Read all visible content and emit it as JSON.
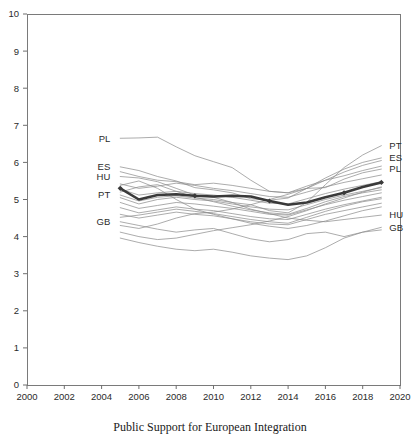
{
  "caption": "Public Support for European Integration",
  "chart_data": {
    "type": "line",
    "title": "",
    "subtitle": "",
    "xlabel": "",
    "ylabel": "",
    "xlim": [
      2000,
      2020
    ],
    "ylim": [
      0,
      10
    ],
    "xticks": [
      2000,
      2002,
      2004,
      2006,
      2008,
      2010,
      2012,
      2014,
      2016,
      2018,
      2020
    ],
    "yticks": [
      0,
      1,
      2,
      3,
      4,
      5,
      6,
      7,
      8,
      9,
      10
    ],
    "grid": false,
    "legend_position": "inline-endpoint-labels",
    "left_labels": [
      {
        "code": "PL",
        "value": 6.65
      },
      {
        "code": "ES",
        "value": 5.88
      },
      {
        "code": "HU",
        "value": 5.62
      },
      {
        "code": "PT",
        "value": 5.12
      },
      {
        "code": "GB",
        "value": 4.4
      }
    ],
    "right_labels": [
      {
        "code": "PT",
        "value": 6.45
      },
      {
        "code": "ES",
        "value": 6.12
      },
      {
        "code": "PL",
        "value": 5.82
      },
      {
        "code": "HU",
        "value": 4.58
      },
      {
        "code": "GB",
        "value": 4.25
      }
    ],
    "x": [
      2005,
      2006,
      2007,
      2008,
      2009,
      2010,
      2011,
      2012,
      2013,
      2014,
      2015,
      2016,
      2017,
      2018,
      2019
    ],
    "series": [
      {
        "name": "PL",
        "highlight": false,
        "values": [
          6.65,
          6.66,
          6.68,
          6.42,
          6.18,
          6.02,
          5.86,
          5.52,
          5.22,
          5.18,
          5.3,
          5.32,
          5.55,
          5.72,
          5.82
        ]
      },
      {
        "name": "ES",
        "highlight": false,
        "values": [
          5.88,
          5.78,
          5.62,
          5.5,
          5.32,
          5.26,
          5.18,
          5.02,
          4.98,
          5.04,
          5.3,
          5.58,
          5.82,
          6.0,
          6.12
        ]
      },
      {
        "name": "HU",
        "highlight": false,
        "values": [
          5.62,
          5.58,
          5.48,
          5.3,
          5.12,
          5.06,
          4.92,
          4.74,
          4.62,
          4.5,
          4.44,
          4.4,
          4.46,
          4.52,
          4.58
        ]
      },
      {
        "name": "PT",
        "highlight": false,
        "values": [
          5.12,
          4.96,
          5.06,
          5.1,
          5.04,
          5.0,
          4.92,
          4.86,
          4.7,
          4.64,
          4.92,
          5.4,
          5.86,
          6.2,
          6.45
        ]
      },
      {
        "name": "GB",
        "highlight": false,
        "values": [
          4.4,
          4.3,
          4.2,
          4.12,
          4.18,
          4.22,
          4.08,
          3.94,
          3.86,
          3.92,
          4.08,
          4.12,
          4.0,
          4.12,
          4.25
        ]
      },
      {
        "name": "country-06",
        "highlight": false,
        "values": [
          5.75,
          5.62,
          5.52,
          5.48,
          5.4,
          5.44,
          5.38,
          5.3,
          5.22,
          5.18,
          5.36,
          5.52,
          5.64,
          5.78,
          5.9
        ]
      },
      {
        "name": "country-07",
        "highlight": false,
        "values": [
          5.42,
          5.3,
          5.36,
          5.44,
          5.38,
          5.3,
          5.24,
          5.16,
          5.08,
          5.06,
          5.2,
          5.34,
          5.46,
          5.56,
          5.66
        ]
      },
      {
        "name": "country-08",
        "highlight": false,
        "values": [
          5.28,
          5.12,
          5.18,
          5.22,
          5.16,
          5.12,
          5.06,
          4.98,
          4.9,
          4.88,
          5.02,
          5.16,
          5.28,
          5.38,
          5.48
        ]
      },
      {
        "name": "country-09",
        "highlight": false,
        "values": [
          5.05,
          4.88,
          5.0,
          5.06,
          5.0,
          4.96,
          4.88,
          4.8,
          4.74,
          4.72,
          4.86,
          5.0,
          5.12,
          5.22,
          5.32
        ]
      },
      {
        "name": "country-10",
        "highlight": false,
        "values": [
          4.92,
          4.76,
          4.84,
          4.92,
          4.88,
          4.82,
          4.76,
          4.68,
          4.6,
          4.58,
          4.72,
          4.86,
          4.98,
          5.08,
          5.18
        ]
      },
      {
        "name": "country-11",
        "highlight": false,
        "values": [
          4.78,
          4.64,
          4.72,
          4.8,
          4.74,
          4.7,
          4.62,
          4.54,
          4.48,
          4.46,
          4.6,
          4.74,
          4.86,
          4.96,
          5.06
        ]
      },
      {
        "name": "country-12",
        "highlight": false,
        "values": [
          4.6,
          4.5,
          4.58,
          4.66,
          4.6,
          4.56,
          4.48,
          4.4,
          4.34,
          4.32,
          4.46,
          4.6,
          4.7,
          4.8,
          4.9
        ]
      },
      {
        "name": "country-13",
        "highlight": false,
        "values": [
          5.38,
          5.5,
          5.3,
          5.0,
          4.74,
          4.6,
          4.48,
          4.36,
          4.28,
          4.22,
          4.3,
          4.42,
          4.56,
          4.7,
          4.8
        ]
      },
      {
        "name": "country-14",
        "highlight": false,
        "values": [
          4.3,
          4.22,
          4.34,
          4.5,
          4.62,
          4.66,
          4.74,
          4.86,
          5.0,
          5.14,
          5.3,
          5.52,
          5.74,
          5.92,
          6.05
        ]
      },
      {
        "name": "country-15",
        "highlight": false,
        "values": [
          4.12,
          4.0,
          3.92,
          3.96,
          4.06,
          4.16,
          4.24,
          4.32,
          4.42,
          4.54,
          4.7,
          4.88,
          5.04,
          5.2,
          5.34
        ]
      },
      {
        "name": "country-16",
        "highlight": false,
        "values": [
          3.96,
          3.84,
          3.74,
          3.66,
          3.62,
          3.66,
          3.58,
          3.48,
          3.42,
          3.38,
          3.48,
          3.7,
          3.96,
          4.12,
          4.18
        ]
      },
      {
        "name": "country-17",
        "highlight": false,
        "values": [
          5.2,
          5.34,
          5.4,
          5.22,
          5.06,
          4.94,
          4.82,
          4.72,
          4.64,
          4.6,
          4.76,
          4.94,
          5.08,
          5.18,
          5.26
        ]
      },
      {
        "name": "country-18",
        "highlight": false,
        "values": [
          4.52,
          4.58,
          4.66,
          4.74,
          4.68,
          4.62,
          4.54,
          4.46,
          4.4,
          4.36,
          4.52,
          4.68,
          4.82,
          4.94,
          5.02
        ]
      },
      {
        "name": "mean",
        "highlight": true,
        "values": [
          5.3,
          5.0,
          5.12,
          5.14,
          5.1,
          5.08,
          5.1,
          5.08,
          4.96,
          4.86,
          4.92,
          5.06,
          5.18,
          5.34,
          5.46
        ]
      }
    ],
    "colors": {
      "background_series": "#8c8c8c",
      "highlight_series": "#3a3a3a",
      "axis": "#6f6f6f",
      "text": "#2b2b2b"
    },
    "geometry": {
      "plot_left": 27,
      "plot_right": 400,
      "plot_top": 14,
      "plot_bottom": 385
    }
  }
}
